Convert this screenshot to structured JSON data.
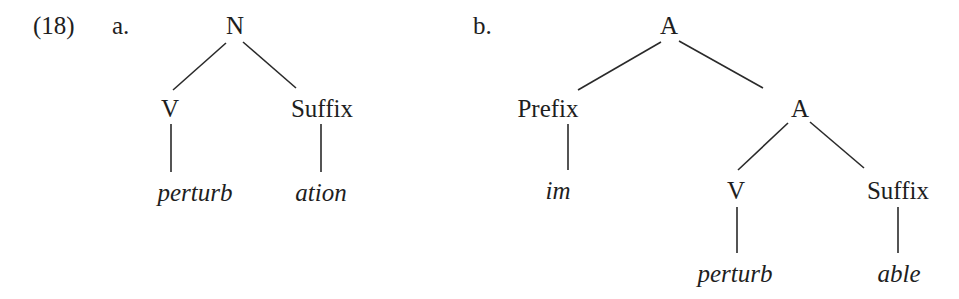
{
  "example": {
    "number": "(18)",
    "a": {
      "label": "a.",
      "root": "N",
      "left": "V",
      "right": "Suffix",
      "left_word": "perturb",
      "right_word": "ation"
    },
    "b": {
      "label": "b.",
      "root": "A",
      "left": "Prefix",
      "left_word": "im",
      "right": "A",
      "right_left": "V",
      "right_right": "Suffix",
      "right_left_word": "perturb",
      "right_right_word": "able"
    }
  }
}
